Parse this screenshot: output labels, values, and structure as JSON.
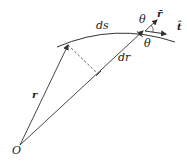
{
  "diagram": {
    "type": "vector-geometry",
    "labels": {
      "origin": "O",
      "position_vector": "r",
      "arc_length": "ds",
      "radial_increment": "dr",
      "angle_top": "θ",
      "angle_bottom": "θ",
      "unit_radial": "r̄",
      "unit_tangent": "t̂"
    },
    "colors": {
      "stroke": "#333333",
      "text": "#222222",
      "background": "#ffffff"
    }
  }
}
